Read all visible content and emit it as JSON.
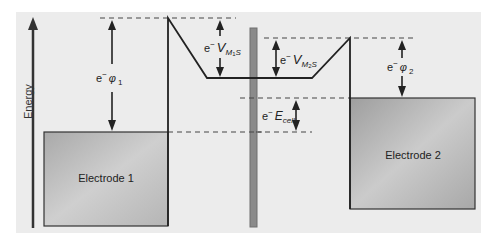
{
  "diagram": {
    "axis_label": "Energy",
    "electrodes": [
      {
        "label": "Electrode 1"
      },
      {
        "label": "Electrode 2"
      }
    ],
    "annotations": {
      "phi1": {
        "prefix": "e",
        "sup": "−",
        "symbol": "φ",
        "sub": "1"
      },
      "phi2": {
        "prefix": "e",
        "sup": "−",
        "symbol": "φ",
        "sub": "2"
      },
      "vm1s": {
        "prefix": "e",
        "sup": "−",
        "symbol": "V",
        "sub": "M",
        "subsub": "1",
        "tail": "S"
      },
      "vm2s": {
        "prefix": "e",
        "sup": "−",
        "symbol": "V",
        "sub": "M",
        "subsub": "2",
        "tail": "S"
      },
      "ecell": {
        "prefix": "e",
        "sup": "−",
        "symbol": "E",
        "sub": "cell"
      }
    },
    "colors": {
      "background": "#ececec",
      "electrode_fill": "#b9b9b9",
      "separator": "#8a8a8a",
      "line": "#222222"
    }
  }
}
